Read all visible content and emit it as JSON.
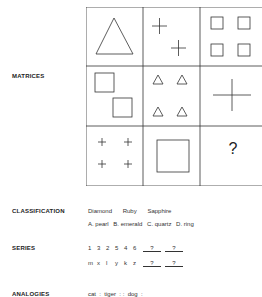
{
  "sections": {
    "matrices": {
      "label": "MATRICES",
      "missing": "?"
    },
    "classification": {
      "label": "CLASSIFICATION",
      "words": [
        "Diamond",
        "Ruby",
        "Sapphire"
      ],
      "options": [
        "A. pearl",
        "B. emerald",
        "C. quartz",
        "D. ring"
      ]
    },
    "series": {
      "label": "SERIES",
      "row1": [
        "1",
        "3",
        "2",
        "5",
        "4",
        "6"
      ],
      "row2": [
        "m",
        "x",
        "l",
        "y",
        "k",
        "z"
      ],
      "blank": "?"
    },
    "analogies": {
      "label": "ANALOGIES",
      "text": "cat  :  tiger  : :  dog  :"
    }
  }
}
